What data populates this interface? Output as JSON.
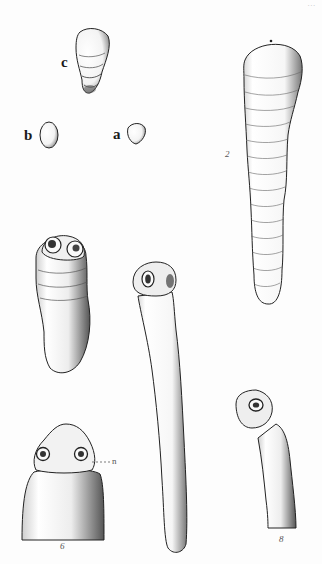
{
  "plate": {
    "corner_mark": "...",
    "background": "#fdfdfd",
    "ink_color": "#1a1a1a"
  },
  "figures": [
    {
      "id": "c",
      "label": "c",
      "description": "segmented conical specimen"
    },
    {
      "id": "b",
      "label": "b",
      "description": "oval egg-shaped specimen"
    },
    {
      "id": "a",
      "label": "a",
      "description": "small rounded specimen"
    },
    {
      "id": "2",
      "label": "2",
      "description": "long segmented worm body"
    },
    {
      "id": "scolex-short",
      "label": "",
      "description": "short body with two suckers"
    },
    {
      "id": "long-neck",
      "label": "",
      "description": "elongated body with scolex"
    },
    {
      "id": "6",
      "label": "6",
      "description": "scolex detail with two suckers",
      "annotation": "n"
    },
    {
      "id": "bent",
      "label": "8",
      "description": "bent neck with scolex"
    }
  ]
}
